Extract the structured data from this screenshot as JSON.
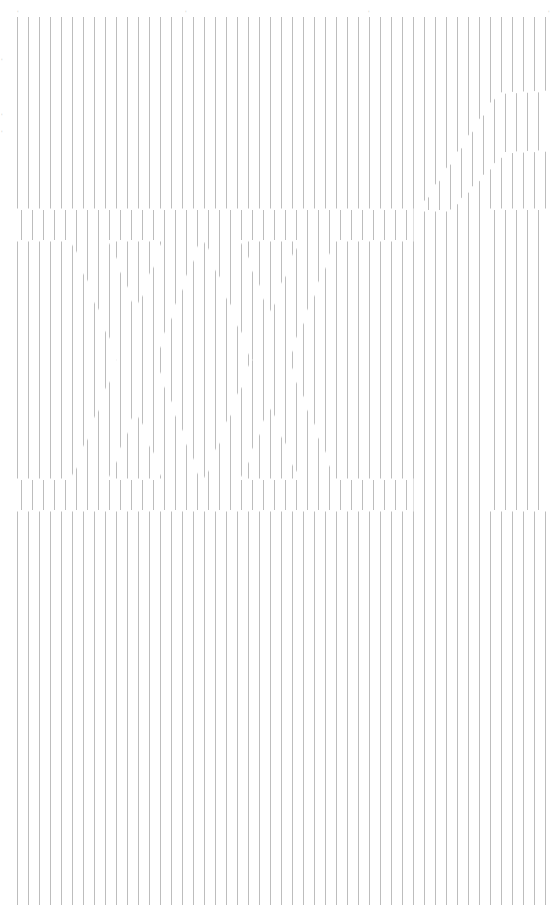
{
  "canvas": {
    "width": 555,
    "height": 919,
    "background": "#ffffff"
  },
  "lines": {
    "color": "#bdbdbd",
    "stroke_width": 1,
    "x_start": 17.5,
    "spacing": 11,
    "count": 49,
    "y_top": 17,
    "y_bottom": 905,
    "shift_dx": 4,
    "segment_gap": 3
  },
  "top_ticks": [
    {
      "x": 17,
      "y": 10,
      "label": "'"
    },
    {
      "x": 185,
      "y": 10,
      "label": "'"
    },
    {
      "x": 368,
      "y": 10,
      "label": "'"
    },
    {
      "x": 548,
      "y": 10,
      "label": "'"
    }
  ],
  "side_marks": [
    {
      "x": 1,
      "y": 58,
      "label": "'"
    },
    {
      "x": 1,
      "y": 113,
      "label": "'"
    },
    {
      "x": 1,
      "y": 130,
      "label": "'"
    }
  ],
  "hidden_regions": [
    {
      "name": "top-bar-left",
      "points": [
        [
          17,
          210
        ],
        [
          412,
          210
        ],
        [
          412,
          240
        ],
        [
          17,
          240
        ]
      ]
    },
    {
      "name": "top-bar-right",
      "points": [
        [
          485,
          210
        ],
        [
          549,
          210
        ],
        [
          549,
          240
        ],
        [
          485,
          240
        ]
      ]
    },
    {
      "name": "bottom-bar-left",
      "points": [
        [
          17,
          480
        ],
        [
          412,
          480
        ],
        [
          412,
          510
        ],
        [
          17,
          510
        ]
      ]
    },
    {
      "name": "bottom-bar-right",
      "points": [
        [
          485,
          480
        ],
        [
          549,
          480
        ],
        [
          549,
          510
        ],
        [
          485,
          510
        ]
      ]
    },
    {
      "name": "x1-diagonal-a",
      "points": [
        [
          72,
          240
        ],
        [
          108,
          240
        ],
        [
          200,
          480
        ],
        [
          164,
          480
        ]
      ]
    },
    {
      "name": "x1-diagonal-b",
      "points": [
        [
          164,
          240
        ],
        [
          200,
          240
        ],
        [
          108,
          480
        ],
        [
          72,
          480
        ]
      ]
    },
    {
      "name": "x2-diagonal-a",
      "points": [
        [
          205,
          240
        ],
        [
          240,
          240
        ],
        [
          335,
          480
        ],
        [
          300,
          480
        ]
      ]
    },
    {
      "name": "x2-diagonal-b",
      "points": [
        [
          300,
          240
        ],
        [
          335,
          240
        ],
        [
          240,
          480
        ],
        [
          205,
          480
        ]
      ]
    },
    {
      "name": "right-stem",
      "points": [
        [
          485,
          240
        ],
        [
          549,
          240
        ],
        [
          549,
          480
        ],
        [
          485,
          480
        ]
      ]
    },
    {
      "name": "f-hook",
      "points": [
        [
          420,
          210
        ],
        [
          450,
          210
        ],
        [
          505,
          152
        ],
        [
          549,
          150
        ],
        [
          549,
          92
        ],
        [
          498,
          94
        ]
      ]
    }
  ]
}
